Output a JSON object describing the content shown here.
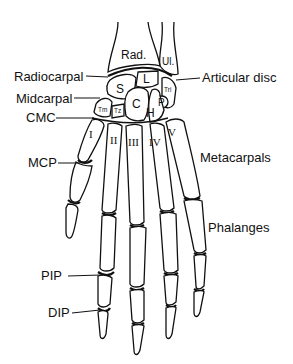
{
  "forearm": {
    "radius": "Rad.",
    "ulna": "Ul."
  },
  "carpals": {
    "scaphoid": "S",
    "lunate": "L",
    "triquetrum": "Tri",
    "pisiform": "P",
    "capitate": "C",
    "hamate": "H",
    "trapezium": "Tm",
    "trapezoid": "Tz"
  },
  "metacarpal_numerals": [
    "I",
    "II",
    "III",
    "IV",
    "V"
  ],
  "labels": {
    "radiocarpal": "Radiocarpal",
    "articular_disc": "Articular disc",
    "midcarpal": "Midcarpal",
    "cmc": "CMC",
    "mcp": "MCP",
    "metacarpals": "Metacarpals",
    "phalanges": "Phalanges",
    "pip": "PIP",
    "dip": "DIP"
  },
  "colors": {
    "line": "#111111",
    "background": "#ffffff"
  }
}
